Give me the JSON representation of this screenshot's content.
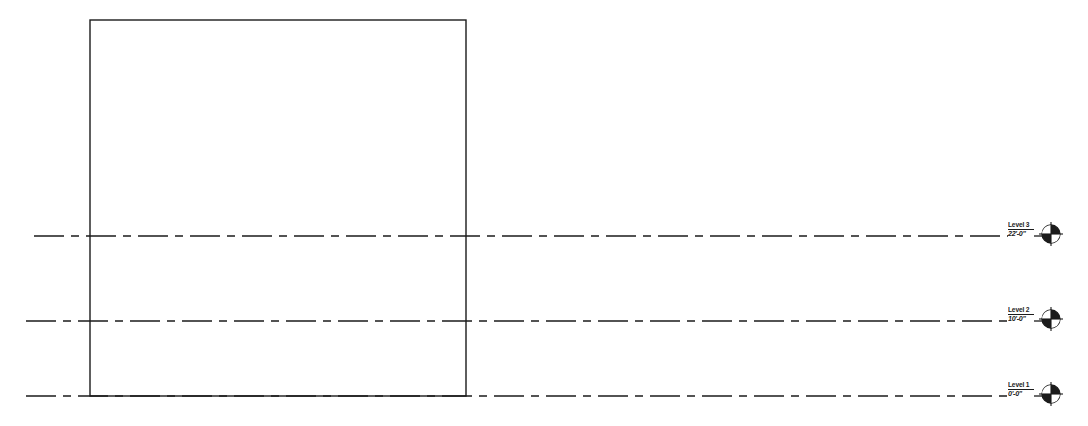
{
  "drawing": {
    "title": "Building Elevation",
    "view_type": "elevation",
    "background_color": "#ffffff",
    "line_color": "#1b1b1b",
    "canvas": {
      "width": 1088,
      "height": 426
    },
    "building_outline": {
      "shape": "rectangle",
      "x": 90,
      "y": 20,
      "width": 376,
      "height": 376,
      "stroke_width": 1.4,
      "fill": "none"
    },
    "levels": [
      {
        "id": "level-3",
        "name": "Level 3",
        "elevation": "22'-0\"",
        "y": 236,
        "line_start_x": 34,
        "line_end_x": 1008,
        "label_x": 1008,
        "marker_x": 1050,
        "marker_type": "level-head-target"
      },
      {
        "id": "level-2",
        "name": "Level 2",
        "elevation": "10'-0\"",
        "y": 321,
        "line_start_x": 26,
        "line_end_x": 1008,
        "label_x": 1008,
        "marker_x": 1050,
        "marker_type": "level-head-target"
      },
      {
        "id": "level-1",
        "name": "Level 1",
        "elevation": "0'-0\"",
        "y": 396,
        "line_start_x": 26,
        "line_end_x": 1008,
        "label_x": 1008,
        "marker_x": 1050,
        "marker_type": "level-head-target"
      }
    ],
    "line_style": {
      "pattern_name": "dash-dot",
      "dash_array": "30 7 8 7",
      "stroke_width": 1.4
    }
  }
}
